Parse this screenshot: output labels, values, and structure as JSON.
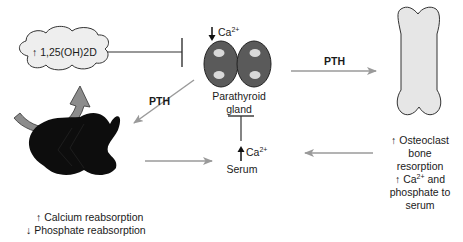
{
  "diagram": {
    "nodes": {
      "vitd": {
        "arrow": "↑",
        "label": "1,25(OH)2D"
      },
      "parathyroid": {
        "stimulus_arrow": "↓",
        "stimulus_ion": "Ca",
        "stimulus_charge": "2+",
        "label_line1": "Parathyroid",
        "label_line2": "gland"
      },
      "serum": {
        "arrow": "↑",
        "ion": "Ca",
        "charge": "2+",
        "label": "Serum"
      },
      "kidney": {
        "line1_arrow": "↑",
        "line1": "Calcium reabsorption",
        "line2_arrow": "↓",
        "line2": "Phosphate reabsorption"
      },
      "bone": {
        "line1_arrow": "↑",
        "line1": "Osteoclast",
        "line2": "bone",
        "line3": "resorption",
        "line4_arrow": "↑",
        "line4_ion": "Ca",
        "line4_charge": "2+",
        "line4_rest": " and",
        "line5": "phosphate to",
        "line6": "serum"
      }
    },
    "edges": {
      "pth_to_bone": "PTH",
      "pth_to_kidney": "PTH"
    },
    "colors": {
      "arrow_gray": "#9a9a9a",
      "gland_fill": "#5a5a5a",
      "gland_dots": "#d9d9d9",
      "bone_fill": "#e6e6e6",
      "cloud_fill": "#eeeeee",
      "kidney_fill": "#0d0d0d",
      "inhibit_line": "#333333"
    }
  }
}
